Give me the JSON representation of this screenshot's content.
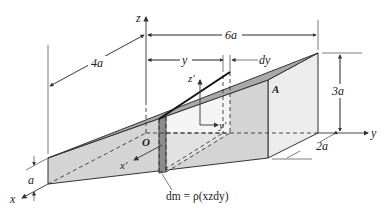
{
  "figure": {
    "type": "3D wedge with mass element slice",
    "axes": {
      "x": "x",
      "y": "y",
      "z": "z",
      "x_prime": "x′",
      "y_prime": "y′",
      "z_prime": "z′"
    },
    "origin_label": "O",
    "point_label": "A",
    "dimensions": {
      "length_y": "6a",
      "length_x": "4a",
      "height": "3a",
      "left_thickness": "a",
      "right_depth": "2a",
      "slice_position": "y",
      "slice_width": "dy"
    },
    "mass_element": "dm = ρ(xzdy)",
    "colors": {
      "top_surface": "#a9a9a9",
      "front_face": "#d4d4d4",
      "slice": "#8c8c8c",
      "right_face": "#ececec",
      "inner_face": "#f4f4f4",
      "lines": "#333333"
    }
  }
}
